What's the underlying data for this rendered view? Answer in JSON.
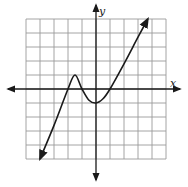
{
  "chart_data": {
    "type": "line",
    "title": "",
    "xlabel": "x",
    "ylabel": "y",
    "xlim": [
      -5,
      5
    ],
    "ylim": [
      -5,
      5
    ],
    "grid": true,
    "grid_step": 1,
    "axis_arrows": true,
    "series": [
      {
        "name": "f(x)",
        "points": [
          [
            -4.0,
            -5.0
          ],
          [
            -3.0,
            -2.6
          ],
          [
            -2.0,
            0.0
          ],
          [
            -1.5,
            1.0
          ],
          [
            -1.0,
            0.0
          ],
          [
            -0.5,
            -0.8
          ],
          [
            0.0,
            -1.0
          ],
          [
            0.5,
            -0.7
          ],
          [
            1.0,
            0.0
          ],
          [
            2.0,
            1.8
          ],
          [
            3.0,
            3.7
          ],
          [
            3.7,
            5.0
          ]
        ],
        "end_arrows": true
      }
    ],
    "key_points": {
      "local_max": [
        -1.5,
        1
      ],
      "local_min": [
        0,
        -1
      ],
      "x_intercepts": [
        -2,
        -1,
        1
      ],
      "y_intercept": -1
    }
  },
  "labels": {
    "x_axis": "x",
    "y_axis": "y"
  },
  "colors": {
    "grid": "#9a9a9a",
    "axis": "#1a1a1a",
    "curve": "#1a1a1a"
  }
}
